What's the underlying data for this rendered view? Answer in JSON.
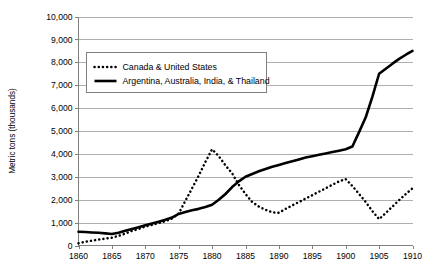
{
  "chart_data": {
    "type": "line",
    "title": "",
    "xlabel": "",
    "ylabel": "Metric tons (thousands)",
    "xlim": [
      1860,
      1910
    ],
    "ylim": [
      0,
      10000
    ],
    "grid": true,
    "legend_position": "top-left-inside",
    "x_tick_labels": [
      "1860",
      "1865",
      "1870",
      "1875",
      "1880",
      "1885",
      "1890",
      "1895",
      "1900",
      "1905",
      "1910"
    ],
    "x_ticks": [
      1860,
      1865,
      1870,
      1875,
      1880,
      1885,
      1890,
      1895,
      1900,
      1905,
      1910
    ],
    "y_tick_labels": [
      "0",
      "1,000",
      "2,000",
      "3,000",
      "4,000",
      "5,000",
      "6,000",
      "7,000",
      "8,000",
      "9,000",
      "10,000"
    ],
    "y_ticks": [
      0,
      1000,
      2000,
      3000,
      4000,
      5000,
      6000,
      7000,
      8000,
      9000,
      10000
    ],
    "x": [
      1860,
      1861,
      1862,
      1863,
      1864,
      1865,
      1866,
      1867,
      1868,
      1869,
      1870,
      1871,
      1872,
      1873,
      1874,
      1875,
      1876,
      1877,
      1878,
      1879,
      1880,
      1881,
      1882,
      1883,
      1884,
      1885,
      1886,
      1887,
      1888,
      1889,
      1890,
      1891,
      1892,
      1893,
      1894,
      1895,
      1896,
      1897,
      1898,
      1899,
      1900,
      1901,
      1902,
      1903,
      1904,
      1905,
      1906,
      1907,
      1908,
      1909,
      1910
    ],
    "series": [
      {
        "name": "Canada & United States",
        "style": "dotted",
        "color": "#000000",
        "values": [
          100,
          160,
          210,
          260,
          300,
          340,
          420,
          520,
          640,
          720,
          830,
          900,
          980,
          1060,
          1180,
          1400,
          1950,
          2500,
          3050,
          3650,
          4200,
          3900,
          3500,
          3150,
          2650,
          2250,
          1900,
          1700,
          1560,
          1450,
          1430,
          1600,
          1750,
          1900,
          2050,
          2200,
          2350,
          2500,
          2650,
          2800,
          2900,
          2600,
          2250,
          1900,
          1500,
          1150,
          1420,
          1700,
          1980,
          2250,
          2500
        ]
      },
      {
        "name": "Argentina, Australia, India, & Thailand",
        "style": "solid",
        "color": "#000000",
        "values": [
          600,
          590,
          570,
          555,
          530,
          500,
          560,
          640,
          720,
          800,
          880,
          960,
          1040,
          1120,
          1220,
          1380,
          1460,
          1540,
          1600,
          1680,
          1780,
          2000,
          2250,
          2550,
          2800,
          3000,
          3120,
          3240,
          3340,
          3440,
          3520,
          3600,
          3680,
          3760,
          3840,
          3900,
          3960,
          4020,
          4080,
          4140,
          4200,
          4320,
          4950,
          5600,
          6500,
          7500,
          7720,
          7940,
          8150,
          8330,
          8500
        ]
      }
    ]
  },
  "legend": {
    "entries": [
      {
        "label": "Canada & United States",
        "marker": "dotted-line-swatch"
      },
      {
        "label": "Argentina, Australia, India, & Thailand",
        "marker": "solid-line-swatch"
      }
    ]
  }
}
